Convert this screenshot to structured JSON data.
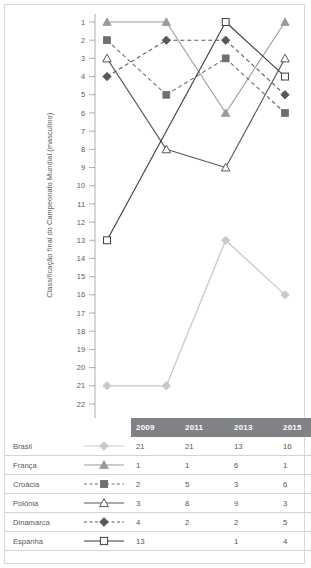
{
  "chart_data": {
    "type": "line",
    "title": "",
    "xlabel": "",
    "ylabel": "Classificação final do Campeonato Mundial (masculino)",
    "categories": [
      "2009",
      "2011",
      "2013",
      "2015"
    ],
    "ylim": [
      1,
      22
    ],
    "y_inverted": true,
    "yticks": [
      1,
      2,
      3,
      4,
      5,
      6,
      7,
      8,
      9,
      10,
      11,
      12,
      13,
      14,
      15,
      16,
      17,
      18,
      19,
      20,
      21,
      22
    ],
    "grid": false,
    "legend_position": "table-below",
    "series": [
      {
        "name": "Brasil",
        "values": [
          21,
          21,
          13,
          16
        ],
        "marker": "diamond-filled",
        "color": "#c9c9c9",
        "line": "solid"
      },
      {
        "name": "França",
        "values": [
          1,
          1,
          6,
          1
        ],
        "marker": "triangle-filled",
        "color": "#9a9a9a",
        "line": "solid"
      },
      {
        "name": "Croácia",
        "values": [
          2,
          5,
          3,
          6
        ],
        "marker": "square-filled",
        "color": "#6d6e71",
        "line": "dashed"
      },
      {
        "name": "Polônia",
        "values": [
          3,
          8,
          9,
          3
        ],
        "marker": "triangle-open",
        "color": "#58585a",
        "line": "solid"
      },
      {
        "name": "Dinamarca",
        "values": [
          4,
          2,
          2,
          5
        ],
        "marker": "diamond-filled",
        "color": "#58585a",
        "line": "dashed"
      },
      {
        "name": "Espanha",
        "values": [
          13,
          null,
          1,
          4
        ],
        "marker": "square-open",
        "color": "#3b3b3d",
        "line": "solid"
      }
    ]
  },
  "table": {
    "header": [
      "",
      "",
      "2009",
      "2011",
      "2013",
      "2015"
    ],
    "rows": [
      {
        "country": "Brasil",
        "values": [
          "21",
          "21",
          "13",
          "16"
        ]
      },
      {
        "country": "França",
        "values": [
          "1",
          "1",
          "6",
          "1"
        ]
      },
      {
        "country": "Croácia",
        "values": [
          "2",
          "5",
          "3",
          "6"
        ]
      },
      {
        "country": "Polônia",
        "values": [
          "3",
          "8",
          "9",
          "3"
        ]
      },
      {
        "country": "Dinamarca",
        "values": [
          "4",
          "2",
          "2",
          "5"
        ]
      },
      {
        "country": "Espanha",
        "values": [
          "13",
          "",
          "1",
          "4"
        ]
      }
    ]
  },
  "colors": {
    "header_band": "#808285",
    "text": "#58585a",
    "rule": "#d3d3d3",
    "frame": "#d8d8d8"
  }
}
